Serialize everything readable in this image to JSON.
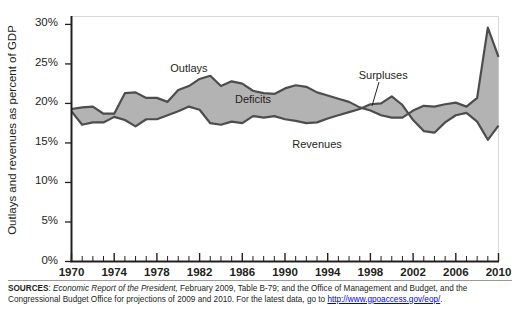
{
  "chart_data": {
    "type": "area",
    "title": "",
    "xlabel": "",
    "ylabel": "Outlays and revenues as percent of GDP",
    "xlim": [
      1970,
      2010
    ],
    "ylim": [
      0,
      31
    ],
    "ytick_values": [
      0,
      5,
      10,
      15,
      20,
      25,
      30
    ],
    "ytick_labels": [
      "0%",
      "5%",
      "10%",
      "15%",
      "20%",
      "25%",
      "30%"
    ],
    "xtick_labels": [
      "1970",
      "1974",
      "1978",
      "1982",
      "1986",
      "1990",
      "1994",
      "1998",
      "2002",
      "2006",
      "2010"
    ],
    "xtick_values": [
      1970,
      1974,
      1978,
      1982,
      1986,
      1990,
      1994,
      1998,
      2002,
      2006,
      2010
    ],
    "minor_xticks_every": 1,
    "grid": false,
    "legend": "in-plot annotations",
    "annotations": [
      {
        "text": "Outlays",
        "x": 1981.0,
        "y": 24.2
      },
      {
        "text": "Deficits",
        "x": 1987.0,
        "y": 20.3
      },
      {
        "text": "Revenues",
        "x": 1993.0,
        "y": 14.6
      },
      {
        "text": "Surpluses",
        "x": 1999.2,
        "y": 23.3
      }
    ],
    "x": [
      1970,
      1971,
      1972,
      1973,
      1974,
      1975,
      1976,
      1977,
      1978,
      1979,
      1980,
      1981,
      1982,
      1983,
      1984,
      1985,
      1986,
      1987,
      1988,
      1989,
      1990,
      1991,
      1992,
      1993,
      1994,
      1995,
      1996,
      1997,
      1998,
      1999,
      2000,
      2001,
      2002,
      2003,
      2004,
      2005,
      2006,
      2007,
      2008,
      2009,
      2010
    ],
    "series": [
      {
        "name": "Outlays",
        "color": "#4d4d4d",
        "values": [
          19.3,
          19.5,
          19.6,
          18.7,
          18.7,
          21.3,
          21.4,
          20.7,
          20.7,
          20.2,
          21.7,
          22.2,
          23.1,
          23.5,
          22.2,
          22.8,
          22.5,
          21.6,
          21.3,
          21.2,
          21.9,
          22.3,
          22.1,
          21.4,
          21.0,
          20.6,
          20.2,
          19.5,
          19.1,
          18.5,
          18.2,
          18.2,
          19.1,
          19.7,
          19.6,
          19.9,
          20.1,
          19.6,
          20.7,
          29.6,
          25.9
        ]
      },
      {
        "name": "Revenues",
        "color": "#4d4d4d",
        "values": [
          19.0,
          17.3,
          17.6,
          17.6,
          18.3,
          17.9,
          17.1,
          18.0,
          18.0,
          18.5,
          19.0,
          19.6,
          19.2,
          17.5,
          17.3,
          17.7,
          17.5,
          18.4,
          18.2,
          18.4,
          18.0,
          17.8,
          17.5,
          17.6,
          18.1,
          18.5,
          18.9,
          19.3,
          19.9,
          20.0,
          20.9,
          19.8,
          17.9,
          16.5,
          16.3,
          17.6,
          18.5,
          18.8,
          17.7,
          15.4,
          17.2
        ]
      }
    ],
    "fill_deficit_color": "#b3b3b3",
    "fill_surplus_color": "#b3b3b3",
    "note": "Shaded band between Outlays and Revenues; labeled Deficits where outlays exceed revenues and Surpluses where revenues exceed outlays (approx. 1998-2001)."
  },
  "axis": {
    "ylabel": "Outlays and revenues as percent of GDP"
  },
  "sources": {
    "lead": "SOURCES",
    "colon": ": ",
    "italic_title": "Economic Report of the President,",
    "rest1": " February 2009, Table B-79; and the Office of Management and Budget, and the Congressional",
    "rest2": "Budget Office for projections of 2009 and 2010. For the latest data, go to ",
    "url": "http://www.gpoaccess.gov/eop/",
    "tail": "."
  }
}
